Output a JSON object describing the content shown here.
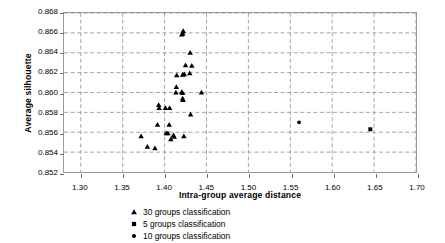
{
  "chart_data": {
    "type": "scatter",
    "title": "",
    "xlabel": "Intra-group average distance",
    "ylabel": "Average silhouette",
    "xlim": [
      1.28,
      1.7
    ],
    "ylim": [
      0.852,
      0.868
    ],
    "xticks": [
      "1.30",
      "1.35",
      "1.40",
      "1.45",
      "1.50",
      "1.55",
      "1.60",
      "1.65",
      "1.70"
    ],
    "xtick_values": [
      1.3,
      1.35,
      1.4,
      1.45,
      1.5,
      1.55,
      1.6,
      1.65,
      1.7
    ],
    "yticks": [
      "0.852",
      "0.854",
      "0.856",
      "0.858",
      "0.860",
      "0.862",
      "0.864",
      "0.866",
      "0.868"
    ],
    "ytick_values": [
      0.852,
      0.854,
      0.856,
      0.858,
      0.86,
      0.862,
      0.864,
      0.866,
      0.868
    ],
    "grid": true,
    "grid_style": "dashed",
    "grid_color": "#8c8c99",
    "legend_position": "below",
    "marker_color": "#000000",
    "series": [
      {
        "name": "30 groups classification",
        "marker": "triangle",
        "points": [
          [
            1.4222,
            0.8662
          ],
          [
            1.4205,
            0.86585
          ],
          [
            1.4218,
            0.86595
          ],
          [
            1.4305,
            0.864
          ],
          [
            1.425,
            0.86275
          ],
          [
            1.4325,
            0.8627
          ],
          [
            1.4145,
            0.86175
          ],
          [
            1.4215,
            0.8618
          ],
          [
            1.4235,
            0.86185
          ],
          [
            1.43,
            0.86195
          ],
          [
            1.414,
            0.86055
          ],
          [
            1.4135,
            0.86
          ],
          [
            1.4205,
            0.86005
          ],
          [
            1.4215,
            0.85995
          ],
          [
            1.444,
            0.86
          ],
          [
            1.4215,
            0.8594
          ],
          [
            1.422,
            0.85925
          ],
          [
            1.393,
            0.85875
          ],
          [
            1.3935,
            0.85845
          ],
          [
            1.401,
            0.85845
          ],
          [
            1.406,
            0.85845
          ],
          [
            1.431,
            0.8578
          ],
          [
            1.3915,
            0.85675
          ],
          [
            1.4055,
            0.85675
          ],
          [
            1.372,
            0.8556
          ],
          [
            1.402,
            0.8559
          ],
          [
            1.404,
            0.8559
          ],
          [
            1.4105,
            0.8557
          ],
          [
            1.4115,
            0.85555
          ],
          [
            1.423,
            0.8556
          ],
          [
            1.4075,
            0.8553
          ],
          [
            1.3795,
            0.85455
          ],
          [
            1.3885,
            0.8544
          ]
        ]
      },
      {
        "name": "5 groups classification",
        "marker": "square",
        "points": [
          [
            1.6455,
            0.8563
          ]
        ]
      },
      {
        "name": "10 groups classification",
        "marker": "circle",
        "points": [
          [
            1.5605,
            0.857
          ]
        ]
      }
    ]
  }
}
